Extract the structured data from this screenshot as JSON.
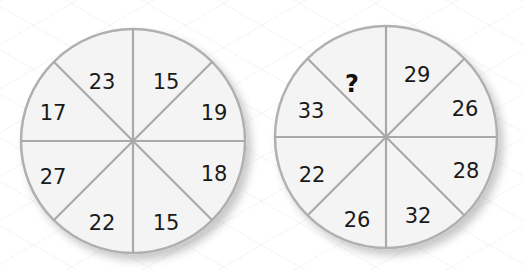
{
  "puzzle": {
    "type": "number-wheel",
    "wheels": [
      {
        "name": "left",
        "segments": [
          "23",
          "15",
          "19",
          "18",
          "15",
          "22",
          "27",
          "17"
        ]
      },
      {
        "name": "right",
        "segments": [
          "?",
          "29",
          "26",
          "28",
          "32",
          "26",
          "22",
          "33"
        ]
      }
    ],
    "unknown_symbol": "?"
  },
  "colors": {
    "segment_fill": "#f4f4f4",
    "divider": "#a9a9a9",
    "rim": "#b0b0b0",
    "text": "#1a1a1a"
  }
}
